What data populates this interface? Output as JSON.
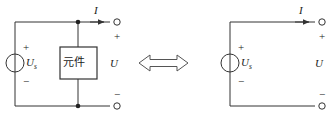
{
  "diagram": {
    "stroke_color": "#333333",
    "text_color": "#1a1a1a",
    "background": "#ffffff",
    "equivalence_symbol": "double-headed-arrow",
    "left_circuit": {
      "name": "source-with-element",
      "source": {
        "label_main": "U",
        "label_sub": "s",
        "plus": "+",
        "minus": "−",
        "symbol": "voltage-source-circle"
      },
      "element_box": {
        "label": "元件"
      },
      "current_label": "I",
      "voltage_label": "U",
      "terminal_plus": "+",
      "terminal_minus": "−"
    },
    "right_circuit": {
      "name": "source-only",
      "source": {
        "label_main": "U",
        "label_sub": "s",
        "plus": "+",
        "minus": "−",
        "symbol": "voltage-source-circle"
      },
      "current_label": "I",
      "voltage_label": "U",
      "terminal_plus": "+",
      "terminal_minus": "−"
    }
  }
}
